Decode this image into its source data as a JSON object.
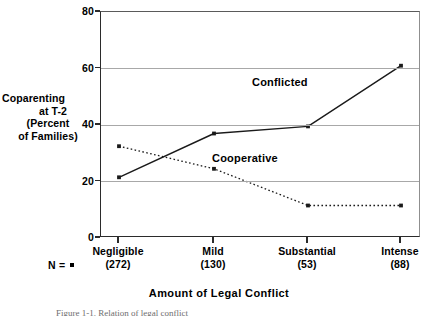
{
  "chart_data": {
    "type": "line",
    "title": "",
    "xlabel": "Amount of Legal Conflict",
    "ylabel": "Coparenting at T-2 (Percent of Families)",
    "categories": [
      "Negligible",
      "Mild",
      "Substantial",
      "Intense"
    ],
    "category_n": [
      "(272)",
      "(130)",
      "(53)",
      "(88)"
    ],
    "n_prefix": "N =",
    "ylim": [
      0,
      80
    ],
    "yticks": [
      0,
      20,
      40,
      60,
      80
    ],
    "ytick_labels": [
      "0",
      "20",
      "40",
      "60",
      "80"
    ],
    "grid": true,
    "legend_position": "inline-annotations",
    "series": [
      {
        "name": "Conflicted",
        "values": [
          21.5,
          37.0,
          39.5,
          61.0
        ],
        "style": "solid",
        "marker": "square",
        "color": "#1a1a1a"
      },
      {
        "name": "Cooperative",
        "values": [
          32.5,
          24.5,
          11.5,
          11.5
        ],
        "style": "dotted",
        "marker": "square",
        "color": "#1a1a1a"
      }
    ],
    "annotations": [
      {
        "text": "Conflicted",
        "x_frac": 0.52,
        "y_value": 68
      },
      {
        "text": "Cooperative",
        "x_frac": 0.37,
        "y_value": 30
      }
    ]
  },
  "axis": {
    "y_title_lines": [
      "Coparenting",
      "at T-2",
      "(Percent",
      "of Families)"
    ],
    "x_title": "Amount of Legal Conflict"
  },
  "caption": {
    "text": "Figure 1-1.  Relation of legal conflict"
  },
  "colors": {
    "axis": "#2b2b2b",
    "grid": "#a8a8a8",
    "series": "#1a1a1a",
    "background": "#ffffff"
  }
}
